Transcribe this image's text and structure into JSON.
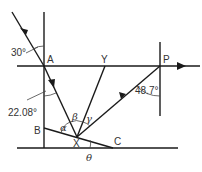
{
  "diagram": {
    "type": "ray-reflection-geometry",
    "points": {
      "A": "A",
      "Y": "Y",
      "P": "P",
      "B": "B",
      "X": "X",
      "C": "C"
    },
    "angles": {
      "incident": "30°",
      "refracted": "22.08°",
      "exit": "48.7°",
      "alpha": "α",
      "beta": "β",
      "gamma": "γ",
      "theta": "θ"
    },
    "ink_color": "#1a1a1a"
  }
}
